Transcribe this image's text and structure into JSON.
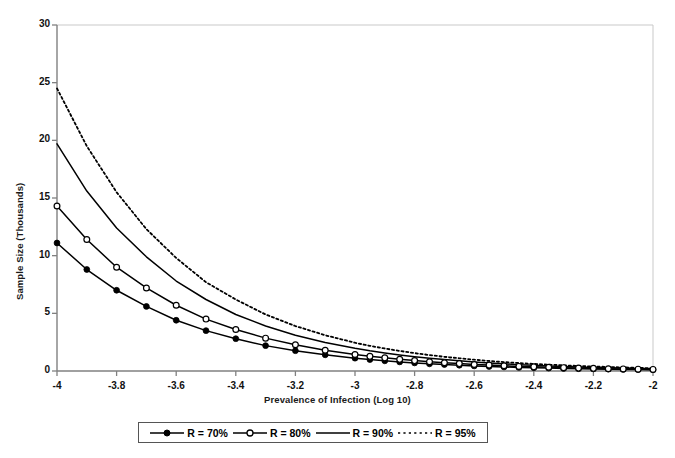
{
  "chart_data": {
    "type": "line",
    "title": "",
    "xlabel": "Prevalence of Infection (Log 10)",
    "ylabel": "Sample Size (Thousands)",
    "xlim": [
      -4,
      -2
    ],
    "ylim": [
      0,
      30
    ],
    "xticks": [
      "-4",
      "-3.8",
      "-3.6",
      "-3.4",
      "-3.2",
      "-3",
      "-2.8",
      "-2.6",
      "-2.4",
      "-2.2",
      "-2"
    ],
    "xtick_values": [
      -4,
      -3.8,
      -3.6,
      -3.4,
      -3.2,
      -3,
      -2.8,
      -2.6,
      -2.4,
      -2.2,
      -2
    ],
    "yticks": [
      "0",
      "5",
      "10",
      "15",
      "20",
      "25",
      "30"
    ],
    "ytick_values": [
      0,
      5,
      10,
      15,
      20,
      25,
      30
    ],
    "grid": false,
    "legend_position": "bottom",
    "x": [
      -4,
      -3.9,
      -3.8,
      -3.7,
      -3.6,
      -3.5,
      -3.4,
      -3.3,
      -3.2,
      -3.1,
      -3,
      -2.95,
      -2.9,
      -2.85,
      -2.8,
      -2.75,
      -2.7,
      -2.65,
      -2.6,
      -2.55,
      -2.5,
      -2.45,
      -2.4,
      -2.35,
      -2.3,
      -2.25,
      -2.2,
      -2.15,
      -2.1,
      -2.05,
      -2
    ],
    "series": [
      {
        "name": "R = 70%",
        "marker": "filled-circle",
        "linestyle": "solid",
        "color": "#000000",
        "values": [
          11.1,
          8.8,
          7.0,
          5.6,
          4.4,
          3.5,
          2.8,
          2.2,
          1.76,
          1.4,
          1.11,
          0.99,
          0.88,
          0.79,
          0.7,
          0.62,
          0.56,
          0.5,
          0.44,
          0.39,
          0.35,
          0.31,
          0.28,
          0.25,
          0.22,
          0.2,
          0.18,
          0.16,
          0.14,
          0.12,
          0.11
        ]
      },
      {
        "name": "R = 80%",
        "marker": "open-circle",
        "linestyle": "solid",
        "color": "#000000",
        "values": [
          14.3,
          11.4,
          9.0,
          7.2,
          5.7,
          4.5,
          3.6,
          2.85,
          2.27,
          1.8,
          1.43,
          1.27,
          1.14,
          1.01,
          0.9,
          0.8,
          0.72,
          0.64,
          0.57,
          0.51,
          0.45,
          0.4,
          0.36,
          0.32,
          0.29,
          0.25,
          0.23,
          0.2,
          0.18,
          0.16,
          0.14
        ]
      },
      {
        "name": "R = 90%",
        "marker": "none",
        "linestyle": "solid",
        "color": "#000000",
        "values": [
          19.7,
          15.6,
          12.4,
          9.9,
          7.8,
          6.2,
          4.9,
          3.9,
          3.1,
          2.48,
          1.97,
          1.75,
          1.56,
          1.39,
          1.24,
          1.11,
          0.99,
          0.88,
          0.78,
          0.7,
          0.62,
          0.55,
          0.49,
          0.44,
          0.39,
          0.35,
          0.31,
          0.28,
          0.25,
          0.22,
          0.2
        ]
      },
      {
        "name": "R = 95%",
        "marker": "none",
        "linestyle": "dotted",
        "color": "#000000",
        "values": [
          24.5,
          19.5,
          15.5,
          12.3,
          9.8,
          7.7,
          6.2,
          4.9,
          3.9,
          3.1,
          2.45,
          2.18,
          1.95,
          1.74,
          1.55,
          1.38,
          1.23,
          1.1,
          0.98,
          0.87,
          0.77,
          0.69,
          0.61,
          0.55,
          0.49,
          0.44,
          0.39,
          0.35,
          0.31,
          0.27,
          0.24
        ]
      }
    ]
  },
  "plot": {
    "axis_color": "#808080",
    "line_color": "#000000",
    "background": "#ffffff"
  },
  "legend": {
    "entries": [
      {
        "label": "R = 70%"
      },
      {
        "label": "R = 80%"
      },
      {
        "label": "R = 90%"
      },
      {
        "label": "R = 95%"
      }
    ]
  }
}
